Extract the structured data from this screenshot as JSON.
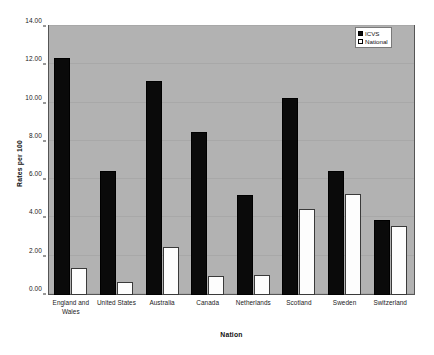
{
  "chart_data": {
    "type": "bar",
    "title": "",
    "xlabel": "Nation",
    "ylabel": "Rates per 100",
    "ylim": [
      0,
      14
    ],
    "ytick_step": 2,
    "ytick_labels": [
      "0.00",
      "2.00",
      "4.00",
      "6.00",
      "8.00",
      "10.00",
      "12.00",
      "14.00"
    ],
    "grid": true,
    "legend_position": "top-right",
    "categories": [
      "England and Wales",
      "United States",
      "Australia",
      "Canada",
      "Netherlands",
      "Scotland",
      "Sweden",
      "Switzerland"
    ],
    "category_lines": [
      [
        "England and",
        "Wales"
      ],
      [
        "United States"
      ],
      [
        "Australia"
      ],
      [
        "Canada"
      ],
      [
        "Netherlands"
      ],
      [
        "Scotland"
      ],
      [
        "Sweden"
      ],
      [
        "Switzerland"
      ]
    ],
    "series": [
      {
        "name": "ICVS",
        "color": "#0a0a0a",
        "values": [
          12.4,
          6.5,
          11.2,
          8.5,
          5.2,
          10.3,
          6.5,
          3.9
        ]
      },
      {
        "name": "National",
        "color": "#ffffff",
        "values": [
          1.4,
          0.7,
          2.5,
          1.0,
          1.05,
          4.5,
          5.3,
          3.6
        ]
      }
    ]
  },
  "legend": {
    "items": [
      {
        "label": "ICVS"
      },
      {
        "label": "National"
      }
    ]
  },
  "colors": {
    "plot_background": "#b2b2b2",
    "page_background": "#ffffff",
    "icvs_bar": "#0a0a0a",
    "national_bar": "#ffffff",
    "gridline": "#a8a8a8",
    "axis": "#555555",
    "text": "#1a1a1a"
  }
}
